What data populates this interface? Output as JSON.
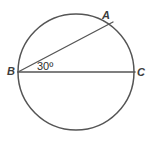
{
  "figure": {
    "background_color": "#ffffff",
    "stroke_color": "#555555",
    "label_color": "#3c3c3c"
  },
  "labels": {
    "point_a": "A",
    "point_b": "B",
    "point_c": "C",
    "angle": "30º"
  },
  "geometry": {
    "circle": {
      "cx": 76,
      "cy": 72,
      "r": 58
    },
    "points": {
      "A": {
        "x": 111,
        "y": 26
      },
      "B": {
        "x": 18,
        "y": 72
      },
      "C": {
        "x": 134,
        "y": 72
      }
    },
    "segments": [
      {
        "name": "diameter-bc",
        "from": "B",
        "to": "C"
      },
      {
        "name": "chord-ba",
        "from": "B",
        "to": "A"
      }
    ],
    "angle_value": 30,
    "angle_vertex": "B"
  }
}
